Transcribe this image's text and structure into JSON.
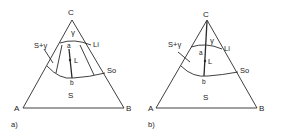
{
  "diagrams": [
    {
      "caption": "a)",
      "vertices": {
        "top": "C",
        "left": "A",
        "right": "B"
      },
      "regions": {
        "gamma": "γ",
        "solid": "S",
        "two_phase": "S+γ"
      },
      "curves": {
        "liquidus": "Li",
        "solidus": "So"
      },
      "points": {
        "a": "a",
        "b": "b",
        "L": "L"
      }
    },
    {
      "caption": "b)",
      "vertices": {
        "top": "C",
        "left": "A",
        "right": "B"
      },
      "regions": {
        "gamma": "γ",
        "solid": "S",
        "two_phase": "S+γ"
      },
      "curves": {
        "liquidus": "Li",
        "solidus": "So"
      },
      "points": {
        "a": "a",
        "b": "b",
        "L": "L"
      }
    }
  ],
  "colors": {
    "line": "#2a2a2a",
    "text": "#222222",
    "background": "#ffffff"
  }
}
